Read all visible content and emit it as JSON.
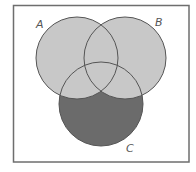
{
  "diagram": {
    "type": "venn",
    "sets": [
      {
        "id": "A",
        "label": "A",
        "cx": 77,
        "cy": 58,
        "r": 41,
        "label_x": 36,
        "label_y": 28
      },
      {
        "id": "B",
        "label": "B",
        "cx": 125,
        "cy": 58,
        "r": 41,
        "label_x": 155,
        "label_y": 26
      },
      {
        "id": "C",
        "label": "C",
        "cx": 101,
        "cy": 104,
        "r": 42,
        "label_x": 126,
        "label_y": 152
      }
    ],
    "shaded_region": "C minus (A union B)",
    "colors": {
      "frame": "#6e6e6e",
      "circle_stroke": "#555555",
      "light_fill": "#c8c8c8",
      "dark_fill": "#6b6b6b",
      "background": "#ffffff"
    },
    "frame": {
      "x": 13.5,
      "y": 5.5,
      "width": 175.5,
      "height": 156.5
    }
  }
}
